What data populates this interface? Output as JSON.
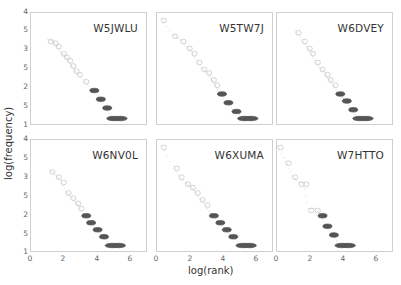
{
  "chart_data": {
    "type": "scatter",
    "title": "",
    "xlabel": "log(rank)",
    "ylabel": "log(frequency)",
    "xlim": [
      0,
      7
    ],
    "ylim": [
      1,
      4
    ],
    "x_ticks": [
      "0",
      "2",
      "4",
      "6"
    ],
    "y_ticks_visible": [
      "4",
      "5",
      "3",
      "5",
      "2",
      "5",
      "1"
    ],
    "grid": false,
    "legend": null,
    "panels": [
      {
        "name": "W5JWLU",
        "points": [
          [
            1.1,
            3.3
          ],
          [
            1.4,
            3.25
          ],
          [
            1.6,
            3.15
          ],
          [
            1.9,
            2.95
          ],
          [
            2.1,
            2.85
          ],
          [
            2.3,
            2.75
          ],
          [
            2.5,
            2.6
          ],
          [
            2.7,
            2.45
          ],
          [
            2.9,
            2.35
          ],
          [
            3.3,
            2.15
          ],
          [
            3.8,
            1.9
          ],
          [
            4.2,
            1.65
          ],
          [
            4.6,
            1.4
          ],
          [
            5.0,
            1.1
          ],
          [
            5.4,
            1.1
          ]
        ]
      },
      {
        "name": "W5TW7J",
        "points": [
          [
            0.3,
            3.9
          ],
          [
            1.0,
            3.45
          ],
          [
            1.5,
            3.3
          ],
          [
            1.9,
            3.1
          ],
          [
            2.2,
            2.95
          ],
          [
            2.5,
            2.7
          ],
          [
            2.8,
            2.5
          ],
          [
            3.1,
            2.4
          ],
          [
            3.4,
            2.2
          ],
          [
            3.6,
            2.05
          ],
          [
            3.9,
            1.8
          ],
          [
            4.3,
            1.55
          ],
          [
            4.8,
            1.3
          ],
          [
            5.3,
            1.1
          ],
          [
            5.7,
            1.1
          ]
        ]
      },
      {
        "name": "W6DVEY",
        "points": [
          [
            1.2,
            3.55
          ],
          [
            1.6,
            3.3
          ],
          [
            1.9,
            3.1
          ],
          [
            2.1,
            2.95
          ],
          [
            2.4,
            2.7
          ],
          [
            2.7,
            2.5
          ],
          [
            3.0,
            2.35
          ],
          [
            3.2,
            2.2
          ],
          [
            3.5,
            2.05
          ],
          [
            3.8,
            1.8
          ],
          [
            4.2,
            1.6
          ],
          [
            4.6,
            1.35
          ],
          [
            5.0,
            1.1
          ],
          [
            5.4,
            1.1
          ]
        ]
      },
      {
        "name": "W6NV0L",
        "points": [
          [
            1.2,
            3.2
          ],
          [
            1.6,
            3.05
          ],
          [
            1.9,
            2.9
          ],
          [
            2.2,
            2.6
          ],
          [
            2.5,
            2.45
          ],
          [
            2.8,
            2.3
          ],
          [
            3.0,
            2.15
          ],
          [
            3.3,
            1.95
          ],
          [
            3.6,
            1.75
          ],
          [
            4.0,
            1.55
          ],
          [
            4.4,
            1.35
          ],
          [
            4.9,
            1.1
          ],
          [
            5.3,
            1.1
          ]
        ]
      },
      {
        "name": "W6XUMA",
        "points": [
          [
            0.3,
            3.9
          ],
          [
            1.1,
            3.3
          ],
          [
            1.4,
            3.05
          ],
          [
            1.8,
            2.85
          ],
          [
            2.1,
            2.75
          ],
          [
            2.4,
            2.6
          ],
          [
            2.7,
            2.4
          ],
          [
            3.0,
            2.25
          ],
          [
            3.4,
            1.95
          ],
          [
            3.8,
            1.75
          ],
          [
            4.2,
            1.55
          ],
          [
            4.6,
            1.35
          ],
          [
            5.2,
            1.1
          ],
          [
            5.6,
            1.1
          ]
        ]
      },
      {
        "name": "W7HTTO",
        "points": [
          [
            0.1,
            3.9
          ],
          [
            0.6,
            3.45
          ],
          [
            1.0,
            3.05
          ],
          [
            1.4,
            2.85
          ],
          [
            1.7,
            2.85
          ],
          [
            2.0,
            2.1
          ],
          [
            2.4,
            2.1
          ],
          [
            2.7,
            1.95
          ],
          [
            3.0,
            1.65
          ],
          [
            3.4,
            1.4
          ],
          [
            3.9,
            1.1
          ],
          [
            4.3,
            1.1
          ]
        ]
      }
    ]
  },
  "axes": {
    "xlabel": "log(rank)",
    "ylabel": "log(frequency)",
    "x_ticks": [
      "0",
      "2",
      "4",
      "6"
    ],
    "y_ticks": [
      "4",
      "5",
      "3",
      "5",
      "2",
      "5",
      "1"
    ]
  },
  "panels": [
    {
      "title": "W5JWLU"
    },
    {
      "title": "W5TW7J"
    },
    {
      "title": "W6DVEY"
    },
    {
      "title": "W6NV0L"
    },
    {
      "title": "W6XUMA"
    },
    {
      "title": "W7HTTO"
    }
  ],
  "colors": {
    "marker_light": "#c8c8c8",
    "marker_dark": "#555555",
    "frame": "#cfcfcf",
    "text": "#333333"
  }
}
